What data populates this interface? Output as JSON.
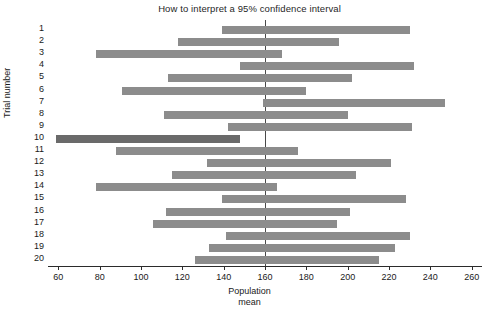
{
  "chart_data": {
    "type": "bar",
    "orientation": "horizontal-interval",
    "title": "How to interpret a 95% confidence interval",
    "xlabel": "Population mean",
    "ylabel": "Trial number",
    "xlim": [
      55,
      265
    ],
    "ylim": [
      0.5,
      20.5
    ],
    "grid": false,
    "legend": null,
    "xticks": [
      60,
      80,
      100,
      120,
      140,
      160,
      180,
      200,
      220,
      240,
      260
    ],
    "xtick_labels": [
      "60",
      "80",
      "100",
      "120",
      "140",
      "160",
      "180",
      "200",
      "220",
      "240",
      "260"
    ],
    "yticks": [
      1,
      2,
      3,
      4,
      5,
      6,
      7,
      8,
      9,
      10,
      11,
      12,
      13,
      14,
      15,
      16,
      17,
      18,
      19,
      20
    ],
    "ytick_labels": [
      "1",
      "2",
      "3",
      "4",
      "5",
      "6",
      "7",
      "8",
      "9",
      "10",
      "11",
      "12",
      "13",
      "14",
      "15",
      "16",
      "17",
      "18",
      "19",
      "20"
    ],
    "reference_line": {
      "axis": "x",
      "value": 160,
      "label": "Population mean",
      "style": "solid",
      "color": "#4a4a4a"
    },
    "bar_color": "#8c8c8c",
    "highlight_color": "#6a6a6a",
    "categories": [
      "1",
      "2",
      "3",
      "4",
      "5",
      "6",
      "7",
      "8",
      "9",
      "10",
      "11",
      "12",
      "13",
      "14",
      "15",
      "16",
      "17",
      "18",
      "19",
      "20"
    ],
    "intervals": [
      {
        "trial": 1,
        "lower": 139,
        "upper": 230,
        "contains_mean": true,
        "highlight": false
      },
      {
        "trial": 2,
        "lower": 118,
        "upper": 196,
        "contains_mean": true,
        "highlight": false
      },
      {
        "trial": 3,
        "lower": 78,
        "upper": 168,
        "contains_mean": true,
        "highlight": false
      },
      {
        "trial": 4,
        "lower": 148,
        "upper": 232,
        "contains_mean": true,
        "highlight": false
      },
      {
        "trial": 5,
        "lower": 113,
        "upper": 202,
        "contains_mean": true,
        "highlight": false
      },
      {
        "trial": 6,
        "lower": 91,
        "upper": 180,
        "contains_mean": true,
        "highlight": false
      },
      {
        "trial": 7,
        "lower": 159,
        "upper": 247,
        "contains_mean": true,
        "highlight": false
      },
      {
        "trial": 8,
        "lower": 111,
        "upper": 200,
        "contains_mean": true,
        "highlight": false
      },
      {
        "trial": 9,
        "lower": 142,
        "upper": 231,
        "contains_mean": true,
        "highlight": false
      },
      {
        "trial": 10,
        "lower": 59,
        "upper": 148,
        "contains_mean": false,
        "highlight": true
      },
      {
        "trial": 11,
        "lower": 88,
        "upper": 176,
        "contains_mean": true,
        "highlight": false
      },
      {
        "trial": 12,
        "lower": 132,
        "upper": 221,
        "contains_mean": true,
        "highlight": false
      },
      {
        "trial": 13,
        "lower": 115,
        "upper": 204,
        "contains_mean": true,
        "highlight": false
      },
      {
        "trial": 14,
        "lower": 78,
        "upper": 166,
        "contains_mean": true,
        "highlight": false
      },
      {
        "trial": 15,
        "lower": 139,
        "upper": 228,
        "contains_mean": true,
        "highlight": false
      },
      {
        "trial": 16,
        "lower": 112,
        "upper": 201,
        "contains_mean": true,
        "highlight": false
      },
      {
        "trial": 17,
        "lower": 106,
        "upper": 195,
        "contains_mean": true,
        "highlight": false
      },
      {
        "trial": 18,
        "lower": 141,
        "upper": 230,
        "contains_mean": true,
        "highlight": false
      },
      {
        "trial": 19,
        "lower": 133,
        "upper": 223,
        "contains_mean": true,
        "highlight": false
      },
      {
        "trial": 20,
        "lower": 126,
        "upper": 215,
        "contains_mean": true,
        "highlight": false
      }
    ]
  },
  "axis": {
    "x_title_line1": "Population",
    "x_title_line2": "mean",
    "y_title": "Trial number"
  }
}
